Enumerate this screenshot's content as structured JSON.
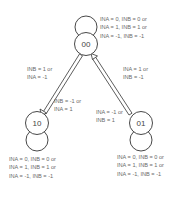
{
  "diagram": {
    "type": "state-transition",
    "nodes": [
      {
        "id": "00",
        "label": "00"
      },
      {
        "id": "10",
        "label": "10"
      },
      {
        "id": "01",
        "label": "01"
      }
    ],
    "self_loops": {
      "00": [
        "INA = 0, INB = 0 or",
        "INA = 1, INB = 1 or",
        "INA = -1, INB = -1"
      ],
      "10": [
        "INA = 0, INB = 0 or",
        "INA = 1, INB = 1 or",
        "INA = -1, INB = -1"
      ],
      "01": [
        "INA = 0, INB = 0 or",
        "INA = 1, INB = 1 or",
        "INA = -1, INB = -1"
      ]
    },
    "edges": {
      "00_to_10": [
        "INB = 1 or",
        "INA = -1"
      ],
      "10_to_00": [
        "INB = -1 or",
        "INA = 1"
      ],
      "00_to_01": [
        "INA = 1 or",
        "INB = -1"
      ],
      "01_to_00": [
        "INA = -1 or",
        "INB = 1"
      ]
    },
    "colors": {
      "stroke": "#333333",
      "text": "#6a6a6a"
    }
  }
}
